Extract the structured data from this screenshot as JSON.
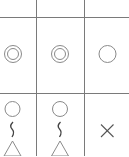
{
  "colors": {
    "background": "#ffffff",
    "grid_line": "#7a7a7a",
    "symbol_stroke": "#8a8a8a",
    "dark_stroke": "#555555"
  },
  "grid": {
    "columns": 3,
    "rows": 3,
    "vertical_lines_x": [
      36,
      84
    ],
    "horizontal_lines_y": [
      17,
      93
    ]
  },
  "cells": [
    {
      "row": 0,
      "col": 0,
      "symbol": "empty"
    },
    {
      "row": 0,
      "col": 1,
      "symbol": "empty"
    },
    {
      "row": 0,
      "col": 2,
      "symbol": "empty"
    },
    {
      "row": 1,
      "col": 0,
      "symbol": "double-circle"
    },
    {
      "row": 1,
      "col": 1,
      "symbol": "double-circle"
    },
    {
      "row": 1,
      "col": 2,
      "symbol": "circle"
    },
    {
      "row": 2,
      "col": 0,
      "symbol": "circle-squiggle-triangle"
    },
    {
      "row": 2,
      "col": 1,
      "symbol": "circle-squiggle-triangle"
    },
    {
      "row": 2,
      "col": 2,
      "symbol": "cross"
    }
  ]
}
